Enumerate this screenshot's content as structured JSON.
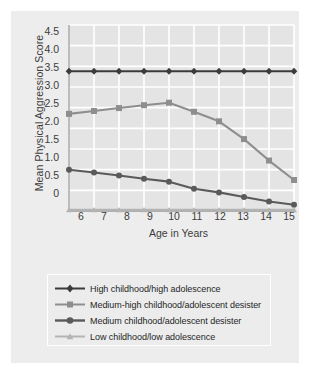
{
  "chart_data": {
    "type": "line",
    "title": "",
    "xlabel": "Age in Years",
    "ylabel": "Mean Physical Aggression Score",
    "x": [
      6,
      7,
      8,
      9,
      10,
      11,
      12,
      13,
      14,
      15
    ],
    "xtick_labels": [
      "6",
      "7",
      "8",
      "9",
      "10",
      "11",
      "12",
      "13",
      "14",
      "15"
    ],
    "ytick_labels": [
      "0",
      "0.5",
      "1.0",
      "1.5",
      "2.0",
      "2.5",
      "3.0",
      "3.5",
      "4.0",
      "4.5"
    ],
    "ytick_values": [
      0,
      0.5,
      1.0,
      1.5,
      2.0,
      2.5,
      3.0,
      3.5,
      4.0,
      4.5
    ],
    "xlim": [
      6,
      15
    ],
    "ylim": [
      0,
      4.5
    ],
    "grid": true,
    "legend_position": "below",
    "series": [
      {
        "name": "High childhood/high adolescence",
        "marker": "diamond",
        "color": "#3b3b3b",
        "values": [
          3.38,
          3.38,
          3.38,
          3.38,
          3.38,
          3.38,
          3.38,
          3.38,
          3.38,
          3.38
        ]
      },
      {
        "name": "Medium-high childhood/adolescent desister",
        "marker": "square",
        "color": "#8e8e8e",
        "values": [
          2.35,
          2.42,
          2.49,
          2.56,
          2.62,
          2.4,
          2.17,
          1.74,
          1.22,
          0.75
        ]
      },
      {
        "name": "Medium childhood/adolescent desister",
        "marker": "circle",
        "color": "#5a5a5a",
        "values": [
          1.0,
          0.93,
          0.86,
          0.78,
          0.71,
          0.54,
          0.45,
          0.34,
          0.23,
          0.15
        ]
      },
      {
        "name": "Low childhood/low adolescence",
        "marker": "triangle",
        "color": "#b4b4b4",
        "values": [
          0.03,
          0.03,
          0.03,
          0.03,
          0.03,
          0.03,
          0.03,
          0.03,
          0.03,
          0.03
        ]
      }
    ]
  },
  "legend": {
    "items": [
      {
        "label": "High childhood/high adolescence",
        "marker": "diamond",
        "color": "#3b3b3b"
      },
      {
        "label": "Medium-high childhood/adolescent desister",
        "marker": "square",
        "color": "#8e8e8e"
      },
      {
        "label": "Medium childhood/adolescent desister",
        "marker": "circle",
        "color": "#5a5a5a"
      },
      {
        "label": "Low childhood/low adolescence",
        "marker": "triangle",
        "color": "#b4b4b4"
      }
    ]
  },
  "colors": {
    "figure_background": "#ffffff",
    "panel_background": "#ededed",
    "plot_background": "#e4e4e4",
    "gridline": "#ffffff",
    "axis": "#9a9a9a",
    "text": "#3c3c3c"
  }
}
